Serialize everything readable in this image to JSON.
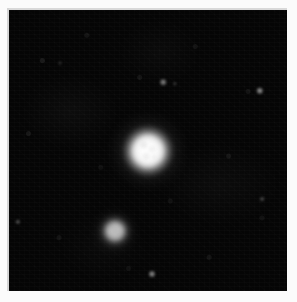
{
  "image": {
    "title": "Astronomical field image",
    "canvas_width": 297,
    "canvas_height": 302,
    "background_color": "#fbfbfb",
    "sky_color": "#050505",
    "plate": {
      "x": 9,
      "y": 10,
      "width": 278,
      "height": 281
    }
  },
  "objects": [
    {
      "name": "primary-nebulous-object",
      "cx": 148,
      "cy": 151,
      "core_diameter": 32,
      "inner_halo_diameter": 46,
      "outer_halo_diameter": 74,
      "peak_color": "#ffffff",
      "relative_brightness": 1.0
    },
    {
      "name": "secondary-nebulous-object",
      "cx": 115,
      "cy": 231,
      "core_diameter": 18,
      "inner_halo_diameter": 27,
      "outer_halo_diameter": 44,
      "peak_color": "#e8e8e8",
      "relative_brightness": 0.52
    }
  ],
  "field_stars": [
    {
      "name": "field-star-1",
      "cx": 163,
      "cy": 82,
      "size": 3.0,
      "brightness": 0.62
    },
    {
      "name": "field-star-2",
      "cx": 260,
      "cy": 91,
      "size": 3.4,
      "brightness": 0.7
    },
    {
      "name": "field-star-3",
      "cx": 152,
      "cy": 274,
      "size": 3.2,
      "brightness": 0.66
    },
    {
      "name": "field-star-4",
      "cx": 18,
      "cy": 222,
      "size": 2.4,
      "brightness": 0.4
    },
    {
      "name": "field-star-5",
      "cx": 262,
      "cy": 199,
      "size": 2.2,
      "brightness": 0.34
    },
    {
      "name": "field-star-6",
      "cx": 175,
      "cy": 84,
      "size": 2.0,
      "brightness": 0.28
    },
    {
      "name": "field-star-7",
      "cx": 60,
      "cy": 63,
      "size": 1.8,
      "brightness": 0.22
    }
  ]
}
